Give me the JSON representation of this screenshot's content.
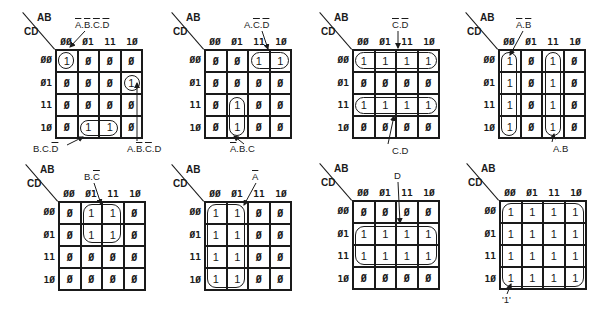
{
  "axis": {
    "row_var": "CD",
    "col_var": "AB"
  },
  "col_headers": [
    "00",
    "01",
    "11",
    "10"
  ],
  "row_headers": [
    "00",
    "01",
    "11",
    "10"
  ],
  "zero_glyph": "Ø",
  "maps": [
    {
      "id": "map1",
      "cells": [
        [
          "1",
          "Ø",
          "Ø",
          "Ø"
        ],
        [
          "Ø",
          "Ø",
          "Ø",
          "1"
        ],
        [
          "Ø",
          "Ø",
          "Ø",
          "Ø"
        ],
        [
          "Ø",
          "1",
          "1",
          "Ø"
        ]
      ],
      "groups": [
        {
          "term": "A̅.B̅.C̅.D̅",
          "term_parts": [
            [
              "A",
              1
            ],
            [
              ".",
              0
            ],
            [
              "B",
              1
            ],
            [
              ".",
              0
            ],
            [
              "C",
              1
            ],
            [
              ".",
              0
            ],
            [
              "D",
              1
            ]
          ]
        },
        {
          "term": "A.B̅.C̅.D",
          "term_parts": [
            [
              "A",
              0
            ],
            [
              ".",
              0
            ],
            [
              "B",
              1
            ],
            [
              ".",
              0
            ],
            [
              "C",
              1
            ],
            [
              ".",
              0
            ],
            [
              "D",
              0
            ]
          ]
        },
        {
          "term": "B.C.D̅",
          "term_parts": [
            [
              "B",
              0
            ],
            [
              ".",
              0
            ],
            [
              "C",
              0
            ],
            [
              ".",
              0
            ],
            [
              "D",
              1
            ]
          ]
        }
      ]
    },
    {
      "id": "map2",
      "cells": [
        [
          "Ø",
          "Ø",
          "1",
          "1"
        ],
        [
          "Ø",
          "Ø",
          "Ø",
          "Ø"
        ],
        [
          "Ø",
          "1",
          "Ø",
          "Ø"
        ],
        [
          "Ø",
          "1",
          "Ø",
          "Ø"
        ]
      ],
      "groups": [
        {
          "term": "A.C̅.D̅",
          "term_parts": [
            [
              "A",
              0
            ],
            [
              ".",
              0
            ],
            [
              "C",
              1
            ],
            [
              ".",
              0
            ],
            [
              "D",
              1
            ]
          ]
        },
        {
          "term": "A̅.B.C",
          "term_parts": [
            [
              "A",
              1
            ],
            [
              ".",
              0
            ],
            [
              "B",
              0
            ],
            [
              ".",
              0
            ],
            [
              "C",
              0
            ]
          ]
        }
      ]
    },
    {
      "id": "map3",
      "cells": [
        [
          "1",
          "1",
          "1",
          "1"
        ],
        [
          "Ø",
          "Ø",
          "Ø",
          "Ø"
        ],
        [
          "1",
          "1",
          "1",
          "1"
        ],
        [
          "Ø",
          "Ø",
          "Ø",
          "Ø"
        ]
      ],
      "groups": [
        {
          "term": "C̅.D̅",
          "term_parts": [
            [
              "C",
              1
            ],
            [
              ".",
              0
            ],
            [
              "D",
              1
            ]
          ]
        },
        {
          "term": "C.D",
          "term_parts": [
            [
              "C",
              0
            ],
            [
              ".",
              0
            ],
            [
              "D",
              0
            ]
          ]
        }
      ]
    },
    {
      "id": "map4",
      "cells": [
        [
          "1",
          "Ø",
          "1",
          "Ø"
        ],
        [
          "1",
          "Ø",
          "1",
          "Ø"
        ],
        [
          "1",
          "Ø",
          "1",
          "Ø"
        ],
        [
          "1",
          "Ø",
          "1",
          "Ø"
        ]
      ],
      "groups": [
        {
          "term": "A̅.B̅",
          "term_parts": [
            [
              "A",
              1
            ],
            [
              ".",
              0
            ],
            [
              "B",
              1
            ]
          ]
        },
        {
          "term": "A.B",
          "term_parts": [
            [
              "A",
              0
            ],
            [
              ".",
              0
            ],
            [
              "B",
              0
            ]
          ]
        }
      ]
    },
    {
      "id": "map5",
      "cells": [
        [
          "Ø",
          "1",
          "1",
          "Ø"
        ],
        [
          "Ø",
          "1",
          "1",
          "Ø"
        ],
        [
          "Ø",
          "Ø",
          "Ø",
          "Ø"
        ],
        [
          "Ø",
          "Ø",
          "Ø",
          "Ø"
        ]
      ],
      "groups": [
        {
          "term": "B.C̅",
          "term_parts": [
            [
              "B",
              0
            ],
            [
              ".",
              0
            ],
            [
              "C",
              1
            ]
          ]
        }
      ]
    },
    {
      "id": "map6",
      "cells": [
        [
          "1",
          "1",
          "Ø",
          "Ø"
        ],
        [
          "1",
          "1",
          "Ø",
          "Ø"
        ],
        [
          "1",
          "1",
          "Ø",
          "Ø"
        ],
        [
          "1",
          "1",
          "Ø",
          "Ø"
        ]
      ],
      "groups": [
        {
          "term": "A̅",
          "term_parts": [
            [
              "A",
              1
            ]
          ]
        }
      ]
    },
    {
      "id": "map7",
      "cells": [
        [
          "Ø",
          "Ø",
          "Ø",
          "Ø"
        ],
        [
          "1",
          "1",
          "1",
          "1"
        ],
        [
          "1",
          "1",
          "1",
          "1"
        ],
        [
          "Ø",
          "Ø",
          "Ø",
          "Ø"
        ]
      ],
      "groups": [
        {
          "term": "D",
          "term_parts": [
            [
              "D",
              0
            ]
          ]
        }
      ]
    },
    {
      "id": "map8",
      "cells": [
        [
          "1",
          "1",
          "1",
          "1"
        ],
        [
          "1",
          "1",
          "1",
          "1"
        ],
        [
          "1",
          "1",
          "1",
          "1"
        ],
        [
          "1",
          "1",
          "1",
          "1"
        ]
      ],
      "groups": [
        {
          "term": "'1'",
          "term_parts": [
            [
              "'1'",
              0
            ]
          ]
        }
      ]
    }
  ]
}
